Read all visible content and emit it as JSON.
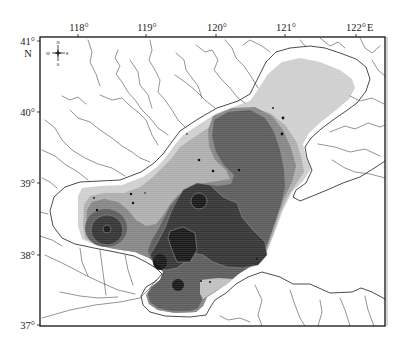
{
  "map": {
    "longitude_labels": [
      "118°",
      "119°",
      "120°",
      "121°",
      "122°"
    ],
    "longitude_hemisphere": "E",
    "latitude_labels": [
      "41°",
      "40°",
      "39°",
      "38°",
      "37°"
    ],
    "latitude_hemisphere": "N",
    "compass": {
      "north": "N",
      "south": "S",
      "east": "E",
      "west": "W"
    },
    "contour_fill_colors": [
      "#cfcfcf",
      "#adadad",
      "#858585",
      "#5b5b5b",
      "#343434",
      "#181818"
    ],
    "highlight_fill_color": "#bfbfbf",
    "frame_color": "#111111",
    "coastline_color": "#1e1e1e",
    "river_color": "#3a3a3a",
    "background_color": "#ffffff"
  }
}
